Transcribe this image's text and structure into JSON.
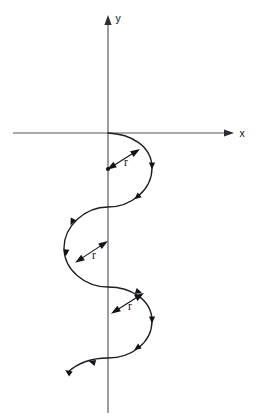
{
  "figure": {
    "background_color": "#ffffff",
    "width": 262,
    "height": 420
  },
  "axes": {
    "x_label": "x",
    "y_label": "y",
    "axis_color": "#55555a",
    "origin": {
      "x": 108,
      "y": 133
    },
    "x_axis": {
      "x_start": 13,
      "x_end": 234,
      "y": 133
    },
    "y_axis": {
      "x": 108,
      "y_start": 15,
      "y_end": 413
    },
    "x_label_pos": {
      "x": 242,
      "y": 137
    },
    "y_label_pos": {
      "x": 118,
      "y": 22
    }
  },
  "curve": {
    "color": "#1d1d22",
    "stroke_width": 1.35,
    "description": "sinusoidal serpentine curve descending through three lobes",
    "path": "M 108 133 C 131 134 152 146 152 168 C 152 190 131 207 108 207 C 85 207 64 226 64 248 C 64 270 85 287 108 287 C 131 287 152 300 152 321 C 152 343 131 358 108 358 C 93 358 78 363 68 372",
    "start_point": {
      "x": 108,
      "y": 133
    },
    "end_point": {
      "x": 68,
      "y": 372
    },
    "direction_markers": [
      {
        "x": 152,
        "y": 166,
        "angle": 90
      },
      {
        "x": 137,
        "y": 197,
        "angle": 140
      },
      {
        "x": 72,
        "y": 222,
        "angle": 115
      },
      {
        "x": 66,
        "y": 253,
        "angle": 95
      },
      {
        "x": 139,
        "y": 292,
        "angle": 20
      },
      {
        "x": 152,
        "y": 320,
        "angle": 90
      },
      {
        "x": 137,
        "y": 348,
        "angle": 145
      },
      {
        "x": 92,
        "y": 362,
        "angle": 196
      },
      {
        "x": 68,
        "y": 372,
        "angle": 215
      }
    ]
  },
  "radius_markers": [
    {
      "id": "radius-1",
      "label": "r",
      "center": {
        "x": 108,
        "y": 169
      },
      "tip": {
        "x": 140,
        "y": 149
      },
      "label_pos": {
        "x": 126,
        "y": 166
      },
      "double_headed": true
    },
    {
      "id": "radius-2",
      "label": "r",
      "center": {
        "x": 76,
        "y": 262
      },
      "tip": {
        "x": 108,
        "y": 241
      },
      "label_pos": {
        "x": 94,
        "y": 259
      },
      "double_headed": true
    },
    {
      "id": "radius-3",
      "label": "r",
      "center": {
        "x": 112,
        "y": 313
      },
      "tip": {
        "x": 144,
        "y": 293
      },
      "label_pos": {
        "x": 130,
        "y": 310
      },
      "double_headed": true
    }
  ],
  "chart_data": {
    "type": "line",
    "title": "",
    "xlabel": "x",
    "ylabel": "y",
    "grid": false,
    "legend": null,
    "annotations": [
      "r",
      "r",
      "r"
    ],
    "series": [
      {
        "name": "serpentine-curve",
        "points": [
          {
            "x": 108,
            "y": 133
          },
          {
            "x": 152,
            "y": 168
          },
          {
            "x": 108,
            "y": 207
          },
          {
            "x": 64,
            "y": 248
          },
          {
            "x": 108,
            "y": 287
          },
          {
            "x": 152,
            "y": 321
          },
          {
            "x": 108,
            "y": 358
          },
          {
            "x": 68,
            "y": 372
          }
        ]
      }
    ]
  }
}
